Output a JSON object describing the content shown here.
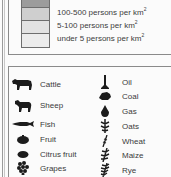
{
  "density_legend": {
    "swatch_colors": [
      "#9c9c9c",
      "#cfcfcf",
      "#e2e2e2",
      "#ececec"
    ],
    "entries": [
      {
        "label": "100-500 persons per km",
        "sup": "2"
      },
      {
        "label": "5-100 persons per km",
        "sup": "2"
      },
      {
        "label": "under 5 persons per km",
        "sup": "2"
      }
    ]
  },
  "resource_legend": {
    "left_column": [
      {
        "icon": "cattle-icon",
        "label": "Cattle"
      },
      {
        "icon": "sheep-icon",
        "label": "Sheep"
      },
      {
        "icon": "fish-icon",
        "label": "Fish"
      },
      {
        "icon": "fruit-icon",
        "label": "Fruit"
      },
      {
        "icon": "citrus-fruit-icon",
        "label": "Citrus fruit"
      },
      {
        "icon": "grapes-icon",
        "label": "Grapes"
      }
    ],
    "right_column": [
      {
        "icon": "oil-icon",
        "label": "Oil"
      },
      {
        "icon": "coal-icon",
        "label": "Coal"
      },
      {
        "icon": "gas-icon",
        "label": "Gas"
      },
      {
        "icon": "oats-icon",
        "label": "Oats"
      },
      {
        "icon": "wheat-icon",
        "label": "Wheat"
      },
      {
        "icon": "maize-icon",
        "label": "Maize"
      },
      {
        "icon": "rye-icon",
        "label": "Rye"
      }
    ]
  }
}
